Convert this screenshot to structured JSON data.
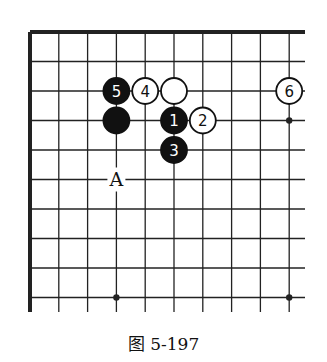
{
  "diagram": {
    "caption": "图 5-197",
    "board": {
      "columns_visible": 10,
      "rows_visible": 10,
      "open_edges": [
        "right",
        "bottom"
      ],
      "bordered_edges": [
        "top",
        "left"
      ],
      "colors": {
        "line": "#222222",
        "black_stone": "#111111",
        "white_stone": "#ffffff",
        "background": "#ffffff"
      }
    },
    "stones": [
      {
        "col": 3,
        "row": 2,
        "color": "black",
        "label": "5"
      },
      {
        "col": 4,
        "row": 2,
        "color": "white",
        "label": "4"
      },
      {
        "col": 5,
        "row": 2,
        "color": "white",
        "label": ""
      },
      {
        "col": 9,
        "row": 2,
        "color": "white",
        "label": "6"
      },
      {
        "col": 3,
        "row": 3,
        "color": "black",
        "label": ""
      },
      {
        "col": 5,
        "row": 3,
        "color": "black",
        "label": "1"
      },
      {
        "col": 6,
        "row": 3,
        "color": "white",
        "label": "2"
      },
      {
        "col": 5,
        "row": 4,
        "color": "black",
        "label": "3"
      }
    ],
    "markers": [
      {
        "col": 3,
        "row": 5,
        "label": "A"
      }
    ],
    "star_points": [
      {
        "col": 9,
        "row": 3
      },
      {
        "col": 3,
        "row": 9
      },
      {
        "col": 9,
        "row": 9
      }
    ]
  }
}
